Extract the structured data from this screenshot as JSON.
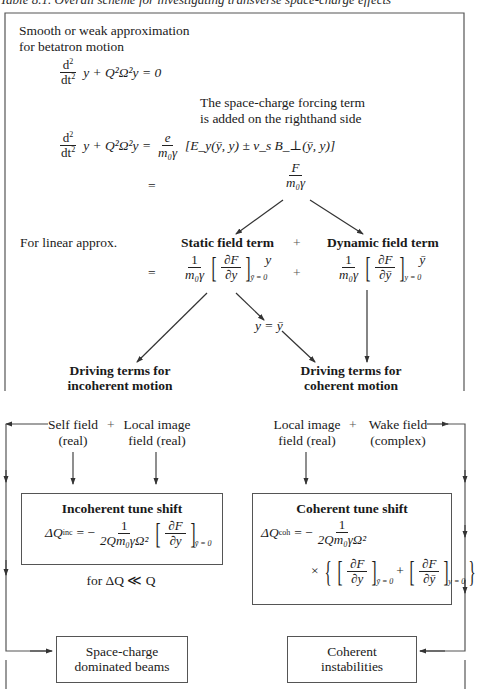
{
  "title": "Table 8.1. Overall scheme for investigating transverse space-charge effects",
  "top_section": {
    "intro_line1": "Smooth or weak approximation",
    "intro_line2": "for betatron motion",
    "eq1": {
      "num": "d",
      "num_sup": "2",
      "den": "dt",
      "den_sup": "2",
      "rest": "y + Q²Ω²y = 0"
    },
    "note_line1": "The space-charge forcing term",
    "note_line2": "is added on the righthand side",
    "eq2": {
      "lhs": "y + Q²Ω²y =",
      "coef_num": "e",
      "coef_den": "m₀γ",
      "rhs": "[E_y(ȳ, y) ± v_s B_⊥(ȳ, y)]"
    },
    "equals": "=",
    "force_frac": {
      "num": "F",
      "den": "m₀γ"
    },
    "linear_label": "For linear approx.",
    "static_term": "Static field term",
    "plus": "+",
    "dynamic_term": "Dynamic field term",
    "static_expr": {
      "coef_num": "1",
      "coef_den": "m₀γ",
      "deriv_num": "∂F",
      "deriv_den": "∂y",
      "subscript": "ȳ = 0",
      "factor": "y"
    },
    "dynamic_expr": {
      "coef_num": "1",
      "coef_den": "m₀γ",
      "deriv_num": "∂F",
      "deriv_den": "∂ȳ",
      "subscript": "y = 0",
      "factor": "ȳ"
    },
    "y_eq": "y = ȳ",
    "drive_incoherent_1": "Driving terms for",
    "drive_incoherent_2": "incoherent motion",
    "drive_coherent_1": "Driving terms for",
    "drive_coherent_2": "coherent motion"
  },
  "bottom_section": {
    "self_field_1": "Self field",
    "self_field_2": "(real)",
    "plus": "+",
    "local_image_left_1": "Local image",
    "local_image_left_2": "field (real)",
    "local_image_right_1": "Local image",
    "local_image_right_2": "field (real)",
    "wake_field_1": "Wake field",
    "wake_field_2": "(complex)",
    "incoherent_box": {
      "heading": "Incoherent tune shift",
      "lhs": "ΔQ",
      "lhs_sub": "inc",
      "eq": "= −",
      "frac_num": "1",
      "frac_den": "2Qm₀γΩ²",
      "deriv_num": "∂F",
      "deriv_den": "∂y",
      "subscript": "ȳ = 0"
    },
    "condition": "for ΔQ ≪ Q",
    "coherent_box": {
      "heading": "Coherent tune shift",
      "lhs": "ΔQ",
      "lhs_sub": "coh",
      "eq": "= −",
      "frac_num": "1",
      "frac_den": "2Qm₀γΩ²",
      "times": "×",
      "deriv1_num": "∂F",
      "deriv1_den": "∂y",
      "sub1": "ȳ = 0",
      "plus": "+",
      "deriv2_num": "∂F",
      "deriv2_den": "∂ȳ",
      "sub2": "y = 0"
    },
    "result_left_1": "Space-charge",
    "result_left_2": "dominated beams",
    "result_right_1": "Coherent",
    "result_right_2": "instabilities"
  },
  "colors": {
    "ink": "#1a1a1a",
    "line": "#555555",
    "paper": "#ffffff"
  }
}
